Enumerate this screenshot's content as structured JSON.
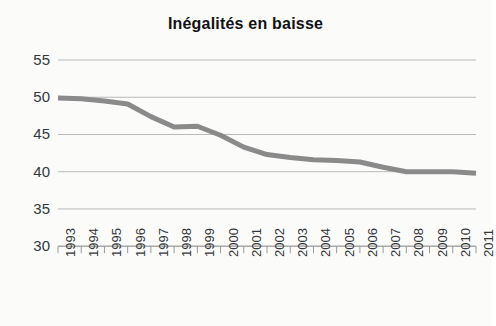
{
  "chart_data": {
    "type": "line",
    "title": "Inégalités en baisse",
    "subtitle": "",
    "xlabel": "",
    "ylabel": "",
    "grid": true,
    "legend": false,
    "legend_position": "none",
    "xlim": [
      1993,
      2011
    ],
    "ylim": [
      30,
      55
    ],
    "y_ticks": [
      30,
      35,
      40,
      45,
      50,
      55
    ],
    "y_tick_labels": [
      "30",
      "35",
      "40",
      "45",
      "50",
      "55"
    ],
    "x_ticks": [
      1993,
      1994,
      1995,
      1996,
      1997,
      1998,
      1999,
      2000,
      2001,
      2002,
      2003,
      2004,
      2005,
      2006,
      2007,
      2008,
      2009,
      2010,
      2011
    ],
    "x_tick_labels": [
      "1993",
      "1994",
      "1995",
      "1996",
      "1997",
      "1998",
      "1999",
      "2000",
      "2001",
      "2002",
      "2003",
      "2004",
      "2005",
      "2006",
      "2007",
      "2008",
      "2009",
      "2010",
      "2011"
    ],
    "series": [
      {
        "name": "Inégalités",
        "color": "#8a8a8a",
        "line_width": 5,
        "x": [
          1993,
          1994,
          1995,
          1996,
          1997,
          1998,
          1999,
          2000,
          2001,
          2002,
          2003,
          2004,
          2005,
          2006,
          2007,
          2008,
          2009,
          2010,
          2011
        ],
        "values": [
          49.9,
          49.8,
          49.5,
          49.1,
          47.4,
          46.0,
          46.1,
          44.9,
          43.3,
          42.3,
          41.9,
          41.6,
          41.5,
          41.3,
          40.6,
          40.0,
          40.0,
          40.0,
          39.8
        ]
      }
    ]
  },
  "axes": {
    "title": "Inégalités en baisse",
    "y_labels": [
      "55",
      "50",
      "45",
      "40",
      "35",
      "30"
    ],
    "x_labels": [
      "1993",
      "1994",
      "1995",
      "1996",
      "1997",
      "1998",
      "1999",
      "2000",
      "2001",
      "2002",
      "2003",
      "2004",
      "2005",
      "2006",
      "2007",
      "2008",
      "2009",
      "2010",
      "2011"
    ]
  },
  "colors": {
    "line": "#8a8a8a",
    "grid": "#b9b9b9",
    "axis": "#9a9a9a",
    "text": "#35383b",
    "title": "#121212",
    "background": "#fbfbfa"
  }
}
